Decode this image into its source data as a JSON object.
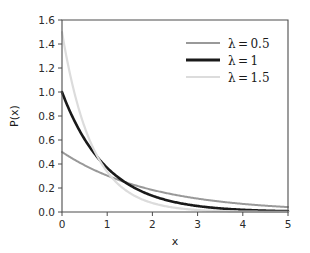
{
  "chart_data": {
    "type": "line",
    "title": "",
    "subtitle": "",
    "xlabel": "x",
    "ylabel": "P(x)",
    "xlim": [
      0,
      5
    ],
    "ylim": [
      0.0,
      1.6
    ],
    "xticks": [
      "0",
      "1",
      "2",
      "3",
      "4",
      "5"
    ],
    "xtick_values": [
      0,
      1,
      2,
      3,
      4,
      5
    ],
    "yticks": [
      "0.0",
      "0.2",
      "0.4",
      "0.6",
      "0.8",
      "1.0",
      "1.2",
      "1.4",
      "1.6"
    ],
    "ytick_values": [
      0.0,
      0.2,
      0.4,
      0.6,
      0.8,
      1.0,
      1.2,
      1.4,
      1.6
    ],
    "grid": false,
    "legend_position": "upper right",
    "series": [
      {
        "name": "λ = 0.5",
        "lambda": 0.5,
        "color": "#999999",
        "linewidth": 2.0,
        "x": [
          0,
          0.25,
          0.5,
          0.75,
          1,
          1.25,
          1.5,
          1.75,
          2,
          2.25,
          2.5,
          2.75,
          3,
          3.25,
          3.5,
          3.75,
          4,
          4.25,
          4.5,
          4.75,
          5
        ],
        "values": [
          0.5,
          0.441,
          0.389,
          0.344,
          0.303,
          0.268,
          0.236,
          0.208,
          0.184,
          0.162,
          0.143,
          0.126,
          0.112,
          0.099,
          0.087,
          0.077,
          0.068,
          0.06,
          0.053,
          0.046,
          0.041
        ]
      },
      {
        "name": "λ = 1",
        "lambda": 1,
        "color": "#1a1a1a",
        "linewidth": 2.6,
        "x": [
          0,
          0.25,
          0.5,
          0.75,
          1,
          1.25,
          1.5,
          1.75,
          2,
          2.25,
          2.5,
          2.75,
          3,
          3.25,
          3.5,
          3.75,
          4,
          4.25,
          4.5,
          4.75,
          5
        ],
        "values": [
          1.0,
          0.779,
          0.607,
          0.472,
          0.368,
          0.287,
          0.223,
          0.174,
          0.135,
          0.105,
          0.082,
          0.064,
          0.05,
          0.039,
          0.03,
          0.024,
          0.018,
          0.014,
          0.011,
          0.009,
          0.007
        ]
      },
      {
        "name": "λ = 1.5",
        "lambda": 1.5,
        "color": "#dcdcdc",
        "linewidth": 2.2,
        "x": [
          0,
          0.25,
          0.5,
          0.75,
          1,
          1.25,
          1.5,
          1.75,
          2,
          2.25,
          2.5,
          2.75,
          3,
          3.25,
          3.5,
          3.75,
          4,
          4.25,
          4.5,
          4.75,
          5
        ],
        "values": [
          1.5,
          1.031,
          0.709,
          0.487,
          0.335,
          0.23,
          0.158,
          0.109,
          0.075,
          0.051,
          0.035,
          0.024,
          0.017,
          0.011,
          0.008,
          0.005,
          0.004,
          0.003,
          0.002,
          0.001,
          0.001
        ]
      }
    ],
    "annotations": []
  },
  "legend": {
    "entries": [
      {
        "label": "λ = 0.5",
        "color": "#999999",
        "linewidth": 2.0
      },
      {
        "label": "λ = 1",
        "color": "#1a1a1a",
        "linewidth": 2.8
      },
      {
        "label": "λ = 1.5",
        "color": "#dcdcdc",
        "linewidth": 2.2
      }
    ]
  },
  "style": {
    "background": "#ffffff",
    "axis_color": "#4d4d4d",
    "tick_label_color": "#2b2b2b",
    "axis_title_color": "#1a1a1a"
  }
}
